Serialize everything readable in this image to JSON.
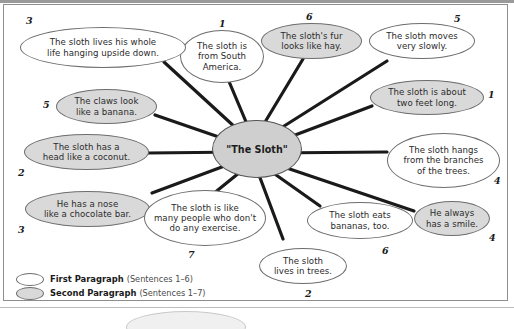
{
  "diagram": {
    "center_label": "\"The Sloth\"",
    "nodes": [
      {
        "id": "south-america",
        "text": "The sloth is\nfrom South\nAmerica.",
        "number": "1",
        "paragraph": "first",
        "fill": "white"
      },
      {
        "id": "upside-down",
        "text": "The sloth lives his whole\nlife hanging upside down.",
        "number": "3",
        "paragraph": "first",
        "fill": "white"
      },
      {
        "id": "claws-banana",
        "text": "The claws look\nlike a banana.",
        "number": "5",
        "paragraph": "second",
        "fill": "gray"
      },
      {
        "id": "head-coconut",
        "text": "The sloth has a\nhead like a coconut.",
        "number": "2",
        "paragraph": "second",
        "fill": "gray"
      },
      {
        "id": "nose-chocolate",
        "text": "He has a nose\nlike a chocolate bar.",
        "number": "3",
        "paragraph": "second",
        "fill": "gray"
      },
      {
        "id": "no-exercise",
        "text": "The sloth is like\nmany people who don't\ndo any exercise.",
        "number": "7",
        "paragraph": "first",
        "fill": "white"
      },
      {
        "id": "lives-in-trees",
        "text": "The sloth\nlives in trees.",
        "number": "2",
        "paragraph": "first",
        "fill": "white"
      },
      {
        "id": "eats-bananas",
        "text": "The sloth eats\nbananas, too.",
        "number": "6",
        "paragraph": "first",
        "fill": "white"
      },
      {
        "id": "always-smile",
        "text": "He always\nhas a smile.",
        "number": "4",
        "paragraph": "second",
        "fill": "gray"
      },
      {
        "id": "hangs-branches",
        "text": "The sloth hangs\nfrom the branches\nof the trees.",
        "number": "4",
        "paragraph": "first",
        "fill": "white"
      },
      {
        "id": "two-feet-long",
        "text": "The sloth is about\ntwo feet long.",
        "number": "1",
        "paragraph": "second",
        "fill": "gray"
      },
      {
        "id": "moves-slowly",
        "text": "The sloth moves\nvery slowly.",
        "number": "5",
        "paragraph": "first",
        "fill": "white"
      },
      {
        "id": "fur-like-hay",
        "text": "The sloth's fur\nlooks like hay.",
        "number": "6",
        "paragraph": "second",
        "fill": "gray"
      }
    ]
  },
  "legend": {
    "first": {
      "label": "First Paragraph",
      "note": "(Sentences 1–6)",
      "fill": "white"
    },
    "second": {
      "label": "Second Paragraph",
      "note": "(Sentences 1–7)",
      "fill": "gray"
    }
  },
  "colors": {
    "node_fill_gray": "#d9d9d9",
    "node_fill_white": "#ffffff",
    "node_stroke": "#6d6d6d",
    "edge": "#1a1a1a",
    "center_fill": "#cfcfcf"
  }
}
